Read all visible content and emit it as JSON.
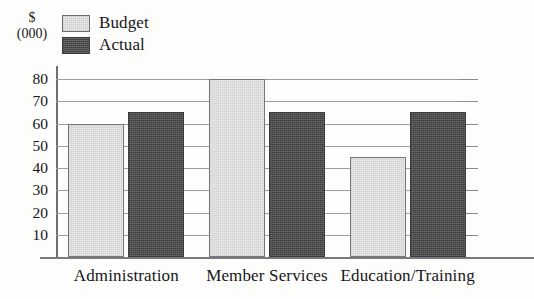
{
  "chart_data": {
    "type": "bar",
    "title": "",
    "subtitle": "",
    "xlabel": "",
    "ylabel": "$ (000)",
    "ylabel_lines": [
      "$",
      "(000)"
    ],
    "categories": [
      "Administration",
      "Member Services",
      "Education/Training"
    ],
    "series": [
      {
        "name": "Budget",
        "values": [
          60,
          80,
          45
        ],
        "color": "#eaeaea"
      },
      {
        "name": "Actual",
        "values": [
          65,
          65,
          65
        ],
        "color": "#4c4c4c"
      }
    ],
    "ylim": [
      0,
      85
    ],
    "yticks": [
      10,
      20,
      30,
      40,
      50,
      60,
      70,
      80
    ],
    "ytick_labels": [
      "10",
      "20",
      "30",
      "40",
      "50",
      "60",
      "70",
      "80"
    ],
    "grid": true,
    "grid_axis": "y",
    "legend": [
      "Budget",
      "Actual"
    ],
    "legend_position": "top-left"
  },
  "legend": {
    "items": [
      {
        "label": "Budget",
        "swatch": "budget-swatch"
      },
      {
        "label": "Actual",
        "swatch": "actual-swatch"
      }
    ]
  },
  "axis": {
    "unit_line1": "$",
    "unit_line2": "(000)"
  },
  "colors": {
    "budget": "#eaeaea",
    "actual": "#4c4c4c",
    "grid": "#9d9d9d",
    "axis": "#6f6f6f",
    "text": "#16161a",
    "background": "#fdfdfb"
  }
}
